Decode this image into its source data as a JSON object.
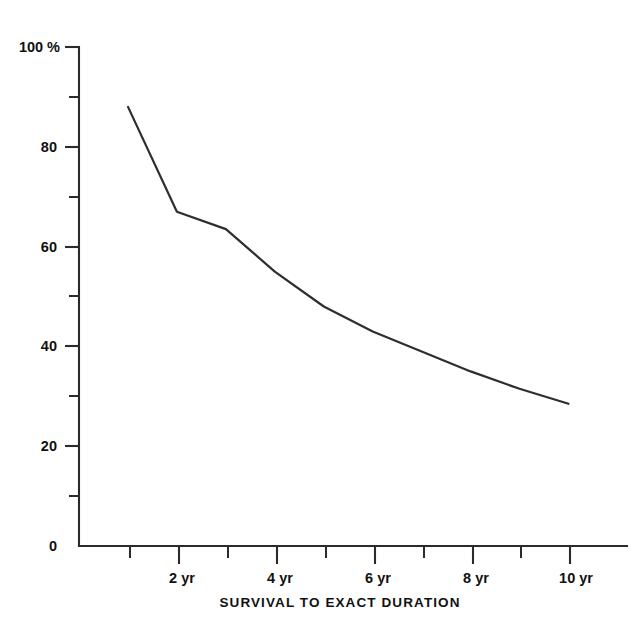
{
  "chart_data": {
    "type": "line",
    "title": "",
    "xlabel": "SURVIVAL TO EXACT DURATION",
    "ylabel": "",
    "x": [
      1,
      2,
      3,
      4,
      5,
      6,
      7,
      8,
      9,
      10
    ],
    "values": [
      88,
      67,
      63.5,
      55,
      48,
      43,
      39,
      35,
      31.5,
      28.5
    ],
    "series": [
      {
        "name": "Survival",
        "values": [
          88,
          67,
          63.5,
          55,
          48,
          43,
          39,
          35,
          31.5,
          28.5
        ]
      }
    ],
    "xlim": [
      0,
      11
    ],
    "ylim": [
      0,
      100
    ],
    "grid": false,
    "legend": false,
    "y_unit": "%",
    "y_major_ticks": [
      0,
      20,
      40,
      60,
      80,
      100
    ],
    "y_minor_ticks": [
      10,
      30,
      50,
      70,
      90
    ],
    "y_tick_labels": [
      "0",
      "20",
      "40",
      "60",
      "80",
      "100 %"
    ],
    "x_major_ticks": [
      2,
      4,
      6,
      8,
      10
    ],
    "x_minor_ticks": [
      1,
      3,
      5,
      7,
      9
    ],
    "x_tick_labels": [
      "2 yr",
      "4 yr",
      "6 yr",
      "8 yr",
      "10 yr"
    ],
    "line_color": "#2e2e2e",
    "axis_color": "#2b2b2b",
    "background_color": "#ffffff"
  },
  "axes": {
    "x_title": "SURVIVAL TO EXACT DURATION",
    "y_labels": {
      "v100": "100 %",
      "v80": "80",
      "v60": "60",
      "v40": "40",
      "v20": "20",
      "v0": "0"
    },
    "x_labels": {
      "t2": "2 yr",
      "t4": "4 yr",
      "t6": "6 yr",
      "t8": "8 yr",
      "t10": "10 yr"
    }
  }
}
